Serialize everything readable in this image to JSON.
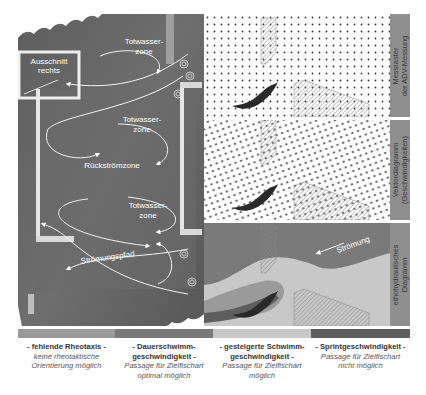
{
  "photo": {
    "labels": {
      "inset": [
        "Ausschnitt",
        "rechts"
      ],
      "deadwater_top": [
        "Totwasser-",
        "zone"
      ],
      "deadwater_mid": [
        "Totwasser-",
        "zone"
      ],
      "backflow": "Rückströmzone",
      "deadwater_low": [
        "Totwasser-",
        "zone"
      ],
      "flowpath": "Strömungspfad"
    }
  },
  "panels": [
    {
      "id": "grid",
      "side_label": [
        "Messraster",
        "der ADV-Messung"
      ]
    },
    {
      "id": "vector",
      "side_label": [
        "Vektordiagramm",
        "(Geschwindigkeiten)"
      ]
    },
    {
      "id": "etho",
      "side_label": [
        "ethohydraulisches",
        "Diagramm"
      ],
      "flow_label": "Strömung"
    }
  ],
  "legend": {
    "colors": [
      "#9a9a9a",
      "#7a7a7a",
      "#c8c8c8",
      "#5e5e5e"
    ],
    "items": [
      {
        "title": "- fehlende Rheotaxis -",
        "desc": [
          "keine rheotaktische",
          "Orientierung möglich"
        ]
      },
      {
        "title": "- Dauerschwimm-",
        "title2": "geschwindigkeit -",
        "desc": [
          "Passage für Zielfischart",
          "optimal möglich"
        ]
      },
      {
        "title": "- gesteigerte Schwimm-",
        "title2": "geschwindigkeit -",
        "desc": [
          "Passage für Zielfischart",
          "möglich"
        ]
      },
      {
        "title": "- Sprintgeschwindigkeit -",
        "desc": [
          "Passage für Zielfischart",
          "nicht möglich"
        ]
      }
    ]
  }
}
